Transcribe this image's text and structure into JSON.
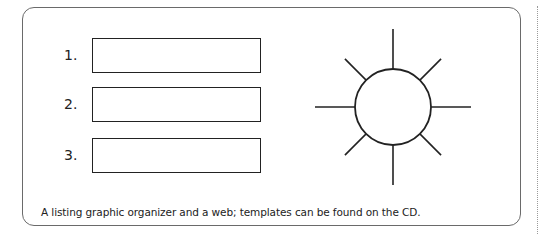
{
  "organizer": {
    "items": [
      {
        "number": "1.",
        "content": ""
      },
      {
        "number": "2.",
        "content": ""
      },
      {
        "number": "3.",
        "content": ""
      }
    ]
  },
  "web": {
    "center_label": "",
    "ray_count": 8
  },
  "caption": "A listing graphic organizer and a web; templates can be found on the CD."
}
